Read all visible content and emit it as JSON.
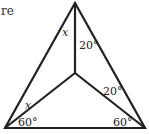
{
  "figure": {
    "cropped_caption": "re",
    "colors": {
      "stroke": "#222222",
      "background": "#ffffff",
      "text": "#222222"
    },
    "vertices": {
      "top": [
        75,
        3
      ],
      "bottom_left": [
        5,
        128
      ],
      "bottom_right": [
        145,
        128
      ],
      "interior": [
        75,
        73
      ]
    },
    "labels": {
      "top_left_angle": "x",
      "top_right_angle": "20°",
      "left_upper_angle": "x",
      "bottom_left_angle": "60°",
      "right_upper_angle": "20°",
      "bottom_right_angle": "60°"
    }
  }
}
